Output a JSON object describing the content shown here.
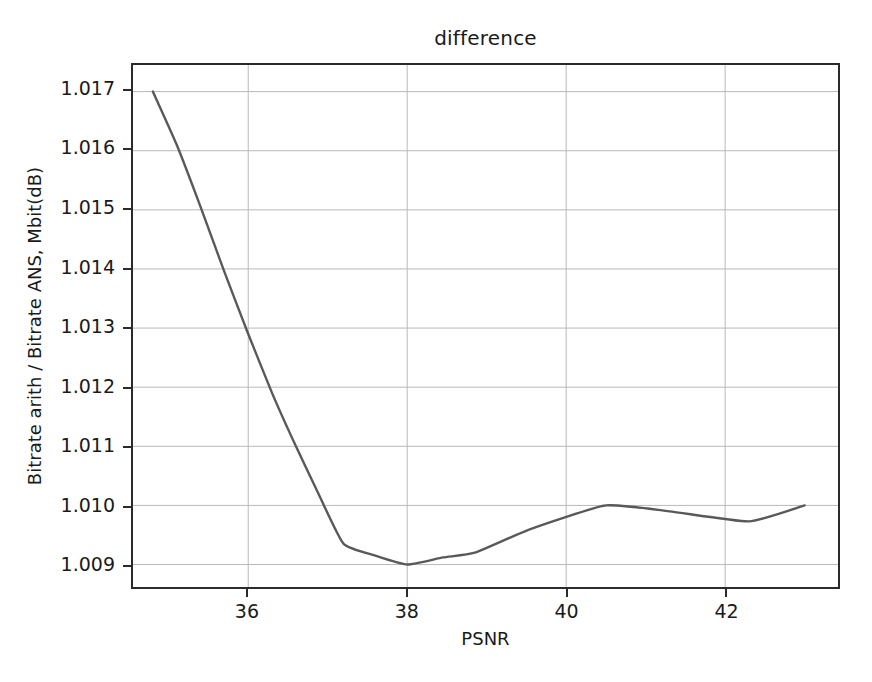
{
  "chart_data": {
    "type": "line",
    "title": "difference",
    "xlabel": "PSNR",
    "ylabel": "Bitrate arith / Bitrate ANS, Mbit(dB)",
    "xlim": [
      34.55,
      43.42
    ],
    "ylim": [
      1.00862,
      1.01745
    ],
    "xticks": [
      36,
      38,
      40,
      42
    ],
    "xtick_labels": [
      "36",
      "38",
      "40",
      "42"
    ],
    "yticks": [
      1.009,
      1.01,
      1.011,
      1.012,
      1.013,
      1.014,
      1.015,
      1.016,
      1.017
    ],
    "ytick_labels": [
      "1.009",
      "1.010",
      "1.011",
      "1.012",
      "1.013",
      "1.014",
      "1.015",
      "1.016",
      "1.017"
    ],
    "grid": true,
    "grid_color": "#b8b8b8",
    "legend": null,
    "series": [
      {
        "name": "difference",
        "color": "#595959",
        "linewidth": 2.4,
        "x": [
          34.8,
          35.1,
          35.4,
          35.7,
          36.0,
          36.3,
          36.6,
          36.9,
          37.2,
          37.6,
          38.0,
          38.45,
          38.85,
          39.55,
          40.5,
          41.3,
          42.3,
          43.0
        ],
        "y": [
          1.017,
          1.0161,
          1.01505,
          1.01395,
          1.0129,
          1.0119,
          1.011,
          1.01015,
          1.00935,
          1.00915,
          1.009,
          1.00912,
          1.0092,
          1.0096,
          1.01,
          1.0099,
          1.00973,
          1.01
        ]
      }
    ]
  }
}
